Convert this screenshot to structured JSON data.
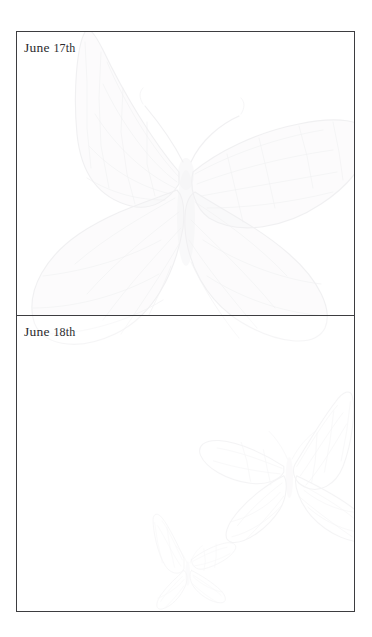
{
  "document": {
    "type": "journal-page",
    "page_background": "#ffffff",
    "frame_border_color": "#3d3d40",
    "text_color": "#2b2b2e",
    "watermark_color": "#5e5a6e"
  },
  "entries": [
    {
      "id": "entry-june-17",
      "date_label": "June 17th",
      "date_month": "June",
      "date_day": "17th",
      "body_text": "",
      "watermarks": [
        "butterfly-large"
      ]
    },
    {
      "id": "entry-june-18",
      "date_label": "June 18th",
      "date_month": "June",
      "date_day": "18th",
      "body_text": "",
      "watermarks": [
        "butterfly-large-bleed",
        "butterfly-medium",
        "butterfly-small"
      ]
    }
  ]
}
